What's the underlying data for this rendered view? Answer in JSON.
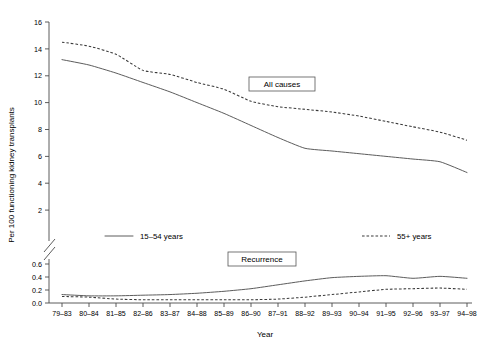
{
  "chart_data": {
    "type": "line",
    "title": "",
    "xlabel": "Year",
    "ylabel": "Per 100 functioning kidney transplants",
    "grid": false,
    "legend_position": "inside-middle",
    "axis_break": true,
    "categories": [
      "79–83",
      "80–84",
      "81–85",
      "82–86",
      "83–87",
      "84–88",
      "85–89",
      "86–90",
      "87–91",
      "88–92",
      "89–93",
      "90–94",
      "91–95",
      "92–96",
      "93–97",
      "94–98"
    ],
    "upper_panel": {
      "label": "All causes",
      "ylim": [
        0,
        16
      ],
      "yticks": [
        0,
        2,
        4,
        6,
        8,
        10,
        12,
        14,
        16
      ],
      "ytick_labels": [
        "0",
        "2",
        "4",
        "6",
        "8",
        "10",
        "12",
        "14",
        "16"
      ],
      "series": [
        {
          "name": "55+ years",
          "style": "dashed",
          "values": [
            14.5,
            14.2,
            13.6,
            12.4,
            12.1,
            11.5,
            11.0,
            10.1,
            9.7,
            9.5,
            9.3,
            9.0,
            8.6,
            8.2,
            7.8,
            7.2
          ]
        },
        {
          "name": "15–54 years",
          "style": "solid",
          "values": [
            13.2,
            12.8,
            12.2,
            11.5,
            10.8,
            10.0,
            9.2,
            8.3,
            7.4,
            6.6,
            6.4,
            6.2,
            6.0,
            5.8,
            5.6,
            4.8
          ]
        }
      ]
    },
    "lower_panel": {
      "label": "Recurrence",
      "ylim": [
        0.0,
        0.7
      ],
      "yticks": [
        0.0,
        0.2,
        0.4,
        0.6
      ],
      "ytick_labels": [
        "0.0",
        "0.2",
        "0.4",
        "0.6"
      ],
      "series": [
        {
          "name": "15–54 years",
          "style": "solid",
          "values": [
            0.13,
            0.11,
            0.11,
            0.12,
            0.13,
            0.15,
            0.18,
            0.22,
            0.28,
            0.34,
            0.39,
            0.41,
            0.42,
            0.38,
            0.41,
            0.38
          ]
        },
        {
          "name": "55+ years",
          "style": "dashed",
          "values": [
            0.1,
            0.09,
            0.06,
            0.05,
            0.05,
            0.05,
            0.05,
            0.05,
            0.06,
            0.09,
            0.13,
            0.17,
            0.21,
            0.22,
            0.23,
            0.21
          ]
        }
      ]
    },
    "legend": [
      {
        "label": "15–54 years",
        "style": "solid"
      },
      {
        "label": "55+ years",
        "style": "dashed"
      }
    ],
    "annotations": [
      {
        "text": "All causes",
        "boxed": true
      },
      {
        "text": "Recurrence",
        "boxed": true
      }
    ]
  }
}
